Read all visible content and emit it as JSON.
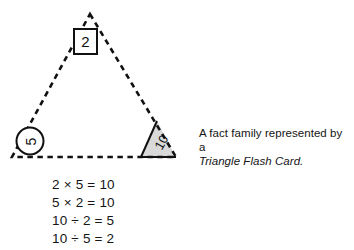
{
  "figure": {
    "name": "triangle-flash-card",
    "shape": "triangle",
    "edge_style": "dashed",
    "stroke_color": "#111111",
    "corners": {
      "top": {
        "value": "2",
        "container": "square",
        "rotation_deg": 0,
        "fill": "#ffffff"
      },
      "bottom_left": {
        "value": "5",
        "container": "circle",
        "rotation_deg": -90,
        "fill": "#ffffff"
      },
      "bottom_right": {
        "value": "10",
        "container": "shaded-triangle",
        "rotation_deg": -60,
        "fill": "#d9d9d9"
      }
    }
  },
  "equations": [
    "2 × 5 = 10",
    "5 × 2 = 10",
    "10 ÷ 2 = 5",
    "10 ÷ 5 = 2"
  ],
  "caption": {
    "line1": "A fact family represented by a",
    "line2": "Triangle Flash Card."
  }
}
